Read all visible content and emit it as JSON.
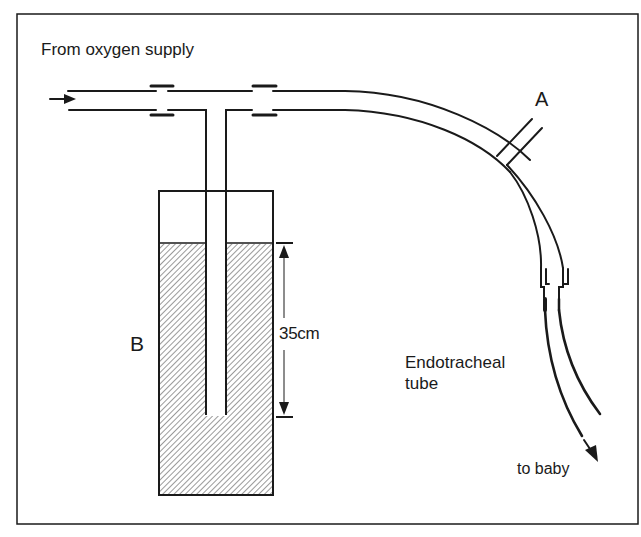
{
  "figure": {
    "type": "schematic",
    "labels": {
      "source": "From oxygen supply",
      "side_port": "A",
      "water_bottle": "B",
      "depth": "35cm",
      "tube_line1": "Endotracheal",
      "tube_line2": "tube",
      "destination": "to baby"
    },
    "colors": {
      "line": "#1a1a1a",
      "background": "#ffffff",
      "hatch": "#555555"
    },
    "measurement": {
      "value": 35,
      "unit": "cm",
      "meaning": "immersion depth of tube in water"
    }
  }
}
